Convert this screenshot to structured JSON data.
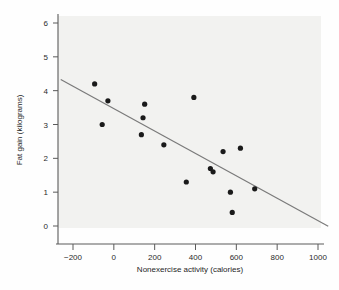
{
  "chart_data": {
    "type": "scatter",
    "title": "",
    "xlabel": "Nonexercise activity (calories)",
    "ylabel": "Fat gain (kilograms)",
    "xlim": [
      -300,
      1060
    ],
    "ylim": [
      -0.5,
      6.4
    ],
    "xticks": [
      -200,
      0,
      200,
      400,
      600,
      800,
      1000
    ],
    "xticklabels": [
      "−200",
      "0",
      "200",
      "400",
      "600",
      "800",
      "1000"
    ],
    "yticks": [
      0,
      1,
      2,
      3,
      4,
      5,
      6
    ],
    "yticklabels": [
      "0",
      "1",
      "2",
      "3",
      "4",
      "5",
      "6"
    ],
    "grid": false,
    "legend": false,
    "point_color": "#1a1a1a",
    "line_color": "#7a7a7a",
    "background_color": "#f2f2f0",
    "x": [
      -94,
      -57,
      -29,
      135,
      143,
      151,
      245,
      355,
      392,
      473,
      486,
      535,
      571,
      580,
      620,
      690
    ],
    "y": [
      4.2,
      3.0,
      3.7,
      2.7,
      3.2,
      3.6,
      2.4,
      1.3,
      3.8,
      1.7,
      1.6,
      2.2,
      1.0,
      0.4,
      2.3,
      1.1
    ],
    "points": [
      {
        "x": -94,
        "y": 4.2
      },
      {
        "x": -57,
        "y": 3.0
      },
      {
        "x": -29,
        "y": 3.7
      },
      {
        "x": 135,
        "y": 2.7
      },
      {
        "x": 143,
        "y": 3.2
      },
      {
        "x": 151,
        "y": 3.6
      },
      {
        "x": 245,
        "y": 2.4
      },
      {
        "x": 355,
        "y": 1.3
      },
      {
        "x": 392,
        "y": 3.8
      },
      {
        "x": 473,
        "y": 1.7
      },
      {
        "x": 486,
        "y": 1.6
      },
      {
        "x": 535,
        "y": 2.2
      },
      {
        "x": 571,
        "y": 1.0
      },
      {
        "x": 580,
        "y": 0.4
      },
      {
        "x": 620,
        "y": 2.3
      },
      {
        "x": 690,
        "y": 1.1
      }
    ],
    "series": [
      {
        "name": "regression line",
        "type": "line",
        "x": [
          -260,
          1050
        ],
        "y": [
          4.33,
          -0.01
        ]
      }
    ]
  }
}
